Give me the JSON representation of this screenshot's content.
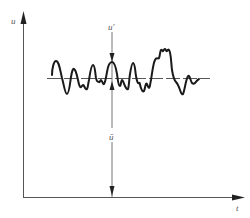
{
  "diagram": {
    "type": "turbulent-velocity-fluctuation",
    "axes": {
      "y_label": "u",
      "x_label": "t"
    },
    "annotations": {
      "fluctuation_label": "u′",
      "mean_label": "ū"
    },
    "colors": {
      "axis": "#555555",
      "signal": "#1a1a1a",
      "mean_line": "#444444",
      "background": "#ffffff"
    }
  }
}
